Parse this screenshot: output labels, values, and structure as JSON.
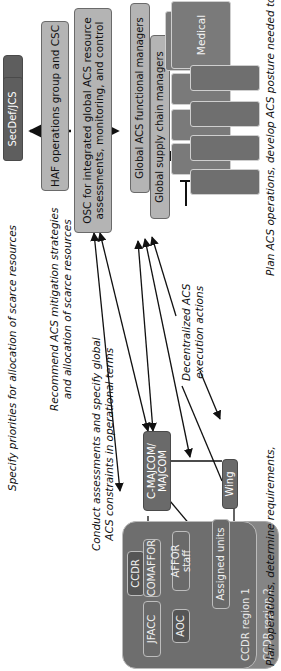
{
  "diagram": {
    "nodes": {
      "secdef": "SecDef/JCS",
      "haf": "HAF operations group and CSC",
      "osc_line1": "OSC for integrated global ACS resource",
      "osc_line2": "assessments, monitoring, and control",
      "functional_managers": "Global ACS functional managers",
      "supply_chain_managers": "Global supply chain managers",
      "functional_areas": [
        "Medical",
        "Civil engineers",
        "Communications",
        "Security forces"
      ],
      "supply_areas": [
        "Movement",
        "Procurement",
        "Maintenance",
        "Storage"
      ],
      "cmajcom_line1": "C-MAJCOM/",
      "cmajcom_line2": "MAJCOM",
      "wing": "Wing",
      "ccdr": "CCDR",
      "jfacc": "JFACC",
      "comaffor": "COMAFFOR",
      "affor_staff": "AFFOR staff",
      "aoc": "AOC",
      "assigned_units": "Assigned units",
      "region1": "CCDR region 1",
      "region2": "CCDR region 2"
    },
    "annotations": {
      "specify_priorities": "Specify priorities for allocation of scarce resources",
      "recommend_line1": "Recommend ACS mitigation strategies",
      "recommend_line2": "and allocation of scarce resources",
      "conduct_line1": "Conduct assessments and specify global",
      "conduct_line2": "ACS constraints in operational terms",
      "decentralized_line1": "Decentralized ACS",
      "decentralized_line2": "execution actions",
      "plan_ops": "Plan operations, determine requirements,",
      "plan_acs": "Plan ACS operations, develop ACS posture needed to"
    },
    "colors": {
      "dark_box": "#5e5e5e",
      "light_box": "#b4b4b4",
      "mid_box": "#7a7a7a",
      "region_fill": "#6e6e6e",
      "region2_fill": "#858585",
      "line": "#111111"
    }
  }
}
